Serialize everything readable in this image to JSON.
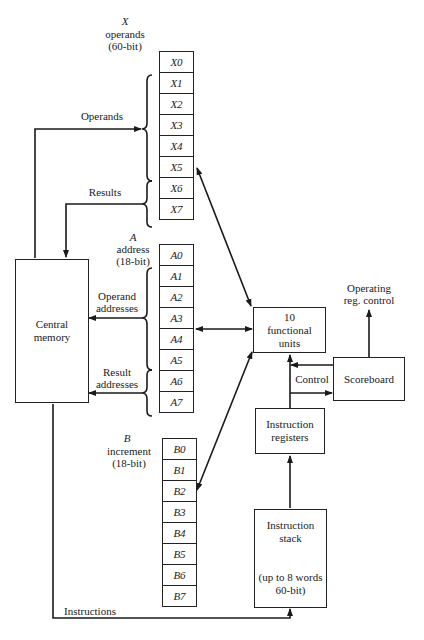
{
  "x_group": {
    "letter": "X",
    "line1": "operands",
    "line2": "(60-bit)",
    "registers": [
      "X0",
      "X1",
      "X2",
      "X3",
      "X4",
      "X5",
      "X6",
      "X7"
    ]
  },
  "a_group": {
    "letter": "A",
    "line1": "address",
    "line2": "(18-bit)",
    "registers": [
      "A0",
      "A1",
      "A2",
      "A3",
      "A4",
      "A5",
      "A6",
      "A7"
    ]
  },
  "b_group": {
    "letter": "B",
    "line1": "increment",
    "line2": "(18-bit)",
    "registers": [
      "B0",
      "B1",
      "B2",
      "B3",
      "B4",
      "B5",
      "B6",
      "B7"
    ]
  },
  "central_memory": {
    "line1": "Central",
    "line2": "memory"
  },
  "functional_units": {
    "line1": "10",
    "line2": "functional",
    "line3": "units"
  },
  "scoreboard": {
    "label": "Scoreboard"
  },
  "instruction_registers": {
    "line1": "Instruction",
    "line2": "registers"
  },
  "instruction_stack": {
    "line1": "Instruction",
    "line2": "stack",
    "line3": "(up to 8 words",
    "line4": "60-bit)"
  },
  "edge_labels": {
    "operands": "Operands",
    "results": "Results",
    "operand_addresses_1": "Operand",
    "operand_addresses_2": "addresses",
    "result_addresses_1": "Result",
    "result_addresses_2": "addresses",
    "control": "Control",
    "operating_reg_control_1": "Operating",
    "operating_reg_control_2": "reg. control",
    "instructions": "Instructions"
  }
}
